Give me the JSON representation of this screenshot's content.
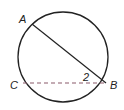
{
  "diagram": {
    "type": "circle-geometry",
    "circle": {
      "cx": 63,
      "cy": 57,
      "r": 45
    },
    "points": {
      "A": {
        "label": "A",
        "x": 32,
        "y": 24
      },
      "B": {
        "label": "B",
        "x": 106,
        "y": 83
      },
      "C": {
        "label": "C",
        "x": 23,
        "y": 83
      }
    },
    "segments": [
      {
        "from": "A",
        "to": "B",
        "style": "solid"
      },
      {
        "from": "C",
        "to": "B",
        "style": "dashed"
      }
    ],
    "angle_label": "2",
    "colors": {
      "stroke": "#222222",
      "dashed": "#8a5a6a",
      "background": "#ffffff"
    }
  }
}
